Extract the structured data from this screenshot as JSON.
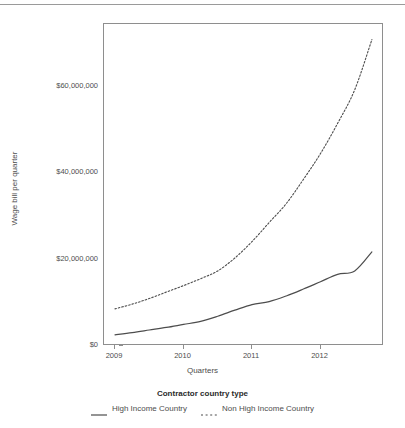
{
  "chart_data": {
    "type": "line",
    "title": "",
    "xlabel": "Quarters",
    "ylabel": "Wage bill per quarter",
    "legend_title": "Contractor country type",
    "legend_position": "bottom",
    "grid": false,
    "xlim": [
      2009.0,
      2012.81
    ],
    "ylim": [
      0,
      74000000
    ],
    "x_tick_labels": [
      "2009",
      "2010",
      "2011",
      "2012"
    ],
    "x_tick_values": [
      2009,
      2010,
      2011,
      2012
    ],
    "y_tick_labels": [
      "$0",
      "$20,000,000",
      "$40,000,000",
      "$60,000,000"
    ],
    "y_tick_values": [
      0,
      20000000,
      40000000,
      60000000
    ],
    "x": [
      2009.0,
      2009.25,
      2009.5,
      2009.75,
      2010.0,
      2010.25,
      2010.5,
      2010.75,
      2011.0,
      2011.25,
      2011.5,
      2011.75,
      2012.0,
      2012.25,
      2012.5,
      2012.75
    ],
    "series": [
      {
        "name": "High Income Country",
        "style": "solid",
        "color": "#4d4d4d",
        "values": [
          2600000,
          3100000,
          3700000,
          4300000,
          5000000,
          5700000,
          6900000,
          8300000,
          9600000,
          10300000,
          11600000,
          13200000,
          14900000,
          16600000,
          17400000,
          21800000
        ]
      },
      {
        "name": "Non High Income Country",
        "style": "dashed",
        "color": "#4d4d4d",
        "values": [
          8600000,
          9700000,
          11000000,
          12500000,
          14000000,
          15600000,
          17400000,
          20400000,
          24200000,
          28600000,
          33000000,
          38600000,
          44600000,
          51600000,
          59400000,
          71000000
        ]
      }
    ]
  },
  "axes": {
    "y_title": "Wage bill per quarter",
    "x_title": "Quarters"
  },
  "legend": {
    "title": "Contractor country type",
    "items": [
      {
        "label": "High Income Country",
        "key": "solid-line-key"
      },
      {
        "label": "Non High Income Country",
        "key": "dashed-line-key"
      }
    ]
  },
  "colors": {
    "line": "#4d4d4d",
    "panel_border": "#8e8e8e",
    "text": "#4d4d4d",
    "title_text": "#2b2b2b",
    "background": "#ffffff"
  }
}
